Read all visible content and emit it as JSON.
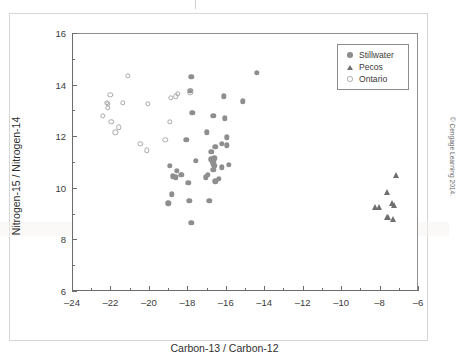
{
  "figure": {
    "credit": "© Cengage Learning 2014."
  },
  "legend": {
    "position": "top-right",
    "entries": [
      {
        "label": "Stillwater",
        "marker": "filled-circle-icon",
        "color": "#8e8e8e"
      },
      {
        "label": "Pecos",
        "marker": "filled-triangle-icon",
        "color": "#6f6f6f"
      },
      {
        "label": "Ontario",
        "marker": "open-circle-icon",
        "color": "#a9a9a9"
      }
    ]
  },
  "chart_data": {
    "type": "scatter",
    "title": "",
    "xlabel": "Carbon-13 / Carbon-12",
    "ylabel": "Nitrogen-15 / Nitrogen-14",
    "xlim": [
      -24,
      -6
    ],
    "ylim": [
      6,
      16
    ],
    "xticks": [
      -24,
      -22,
      -20,
      -18,
      -16,
      -14,
      -12,
      -10,
      -8,
      -6
    ],
    "xticklabels": [
      "–24",
      "–22",
      "–20",
      "–18",
      "–16",
      "–14",
      "–12",
      "–10",
      "–8",
      "–6"
    ],
    "xminor_step": 1,
    "yticks": [
      6,
      8,
      10,
      12,
      14,
      16
    ],
    "yticklabels": [
      "6",
      "8",
      "10",
      "12",
      "14",
      "16"
    ],
    "yminor_step": 1,
    "grid": false,
    "legend_position": "top-right",
    "series": [
      {
        "name": "Stillwater",
        "marker": "filled-circle",
        "color": "#8e8e8e",
        "points": [
          [
            -17.8,
            14.3
          ],
          [
            -14.4,
            14.45
          ],
          [
            -16.1,
            13.55
          ],
          [
            -17.85,
            13.75
          ],
          [
            -15.1,
            13.35
          ],
          [
            -17.75,
            12.9
          ],
          [
            -16.65,
            12.8
          ],
          [
            -16.05,
            12.7
          ],
          [
            -18.05,
            11.85
          ],
          [
            -17.0,
            12.15
          ],
          [
            -15.95,
            11.95
          ],
          [
            -16.2,
            11.7
          ],
          [
            -16.55,
            11.6
          ],
          [
            -15.95,
            11.65
          ],
          [
            -16.75,
            11.4
          ],
          [
            -17.55,
            11.05
          ],
          [
            -16.75,
            11.1
          ],
          [
            -16.7,
            11.05
          ],
          [
            -16.6,
            11.15
          ],
          [
            -16.65,
            10.95
          ],
          [
            -15.85,
            10.9
          ],
          [
            -16.2,
            10.8
          ],
          [
            -16.6,
            10.85
          ],
          [
            -16.65,
            10.7
          ],
          [
            -18.9,
            10.85
          ],
          [
            -18.55,
            10.65
          ],
          [
            -18.3,
            10.5
          ],
          [
            -18.35,
            10.5
          ],
          [
            -18.6,
            10.4
          ],
          [
            -18.75,
            10.45
          ],
          [
            -17.05,
            10.4
          ],
          [
            -16.95,
            10.5
          ],
          [
            -16.35,
            10.35
          ],
          [
            -16.55,
            10.25
          ],
          [
            -17.95,
            10.2
          ],
          [
            -18.8,
            9.75
          ],
          [
            -17.9,
            9.5
          ],
          [
            -16.85,
            9.5
          ],
          [
            -19.0,
            9.4
          ],
          [
            -17.8,
            8.65
          ]
        ]
      },
      {
        "name": "Pecos",
        "marker": "filled-triangle",
        "color": "#6f6f6f",
        "points": [
          [
            -7.15,
            10.5
          ],
          [
            -7.6,
            9.85
          ],
          [
            -7.35,
            9.4
          ],
          [
            -7.25,
            9.35
          ],
          [
            -8.25,
            9.25
          ],
          [
            -8.05,
            9.25
          ],
          [
            -7.6,
            8.85
          ],
          [
            -7.3,
            8.8
          ],
          [
            -7.55,
            8.85
          ]
        ]
      },
      {
        "name": "Ontario",
        "marker": "open-circle",
        "color": "#a9a9a9",
        "points": [
          [
            -21.1,
            14.35
          ],
          [
            -22.0,
            13.6
          ],
          [
            -21.35,
            13.3
          ],
          [
            -22.15,
            13.25
          ],
          [
            -22.15,
            13.1
          ],
          [
            -22.2,
            13.3
          ],
          [
            -20.05,
            13.25
          ],
          [
            -18.85,
            13.5
          ],
          [
            -18.6,
            13.55
          ],
          [
            -18.5,
            13.65
          ],
          [
            -17.85,
            13.7
          ],
          [
            -22.4,
            12.8
          ],
          [
            -21.95,
            12.55
          ],
          [
            -21.55,
            12.35
          ],
          [
            -21.75,
            12.15
          ],
          [
            -18.9,
            12.55
          ],
          [
            -20.45,
            11.7
          ],
          [
            -20.1,
            11.45
          ],
          [
            -19.15,
            11.85
          ]
        ]
      }
    ]
  }
}
